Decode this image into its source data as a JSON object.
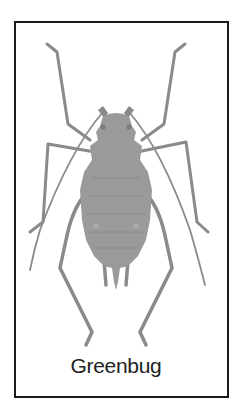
{
  "figure": {
    "caption": "Greenbug",
    "colors": {
      "border": "#1a1a1a",
      "body": "#9a9a9a",
      "legs": "#8a8a8a",
      "background": "#ffffff",
      "caption": "#222222"
    }
  }
}
